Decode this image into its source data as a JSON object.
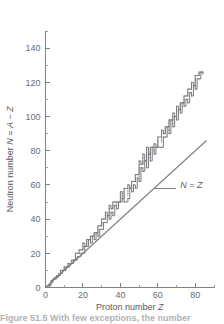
{
  "figure": {
    "caption": "Figure 51.5  With few exceptions, the number"
  },
  "axes": {
    "x": {
      "label_prefix": "Proton number ",
      "label_symbol": "Z",
      "ticks": [
        0,
        20,
        40,
        60,
        80
      ],
      "minor_tick_step": 10,
      "range": [
        0,
        90
      ]
    },
    "y": {
      "label_prefix": "Neutron number ",
      "label_symbol": "N",
      "label_equals": " = ",
      "label_symbol2": "A",
      "label_minus": " − ",
      "label_symbol3": "Z",
      "ticks": [
        0,
        20,
        40,
        60,
        80,
        100,
        120,
        140
      ],
      "minor_tick_step": 10,
      "range": [
        0,
        150
      ]
    }
  },
  "annotations": {
    "nz_line_label": "N = Z"
  },
  "colors": {
    "axis": "#808285",
    "data": "#77797c",
    "text": "#58595b",
    "background": "#ffffff"
  },
  "chart_data": {
    "type": "scatter",
    "title": "",
    "xlabel": "Proton number Z",
    "ylabel": "Neutron number N = A − Z",
    "xlim": [
      0,
      90
    ],
    "ylim": [
      0,
      150
    ],
    "grid": false,
    "legend": null,
    "annotations": [
      {
        "text": "N = Z",
        "x": 72,
        "y": 60,
        "leader_to": {
          "x": 58,
          "y": 58
        }
      }
    ],
    "series": [
      {
        "name": "N = Z reference line",
        "type": "line",
        "x": [
          0,
          86
        ],
        "y": [
          0,
          86
        ]
      },
      {
        "name": "Stable nuclides band",
        "type": "scatter",
        "note": "Band of stable nuclides; N rises faster than Z above Z~20",
        "points": [
          {
            "z": 1,
            "n": 0
          },
          {
            "z": 1,
            "n": 1
          },
          {
            "z": 2,
            "n": 1
          },
          {
            "z": 2,
            "n": 2
          },
          {
            "z": 3,
            "n": 3
          },
          {
            "z": 3,
            "n": 4
          },
          {
            "z": 4,
            "n": 5
          },
          {
            "z": 5,
            "n": 5
          },
          {
            "z": 5,
            "n": 6
          },
          {
            "z": 6,
            "n": 6
          },
          {
            "z": 6,
            "n": 7
          },
          {
            "z": 7,
            "n": 7
          },
          {
            "z": 7,
            "n": 8
          },
          {
            "z": 8,
            "n": 8
          },
          {
            "z": 8,
            "n": 9
          },
          {
            "z": 8,
            "n": 10
          },
          {
            "z": 9,
            "n": 10
          },
          {
            "z": 10,
            "n": 10
          },
          {
            "z": 10,
            "n": 11
          },
          {
            "z": 10,
            "n": 12
          },
          {
            "z": 11,
            "n": 12
          },
          {
            "z": 12,
            "n": 12
          },
          {
            "z": 12,
            "n": 13
          },
          {
            "z": 12,
            "n": 14
          },
          {
            "z": 13,
            "n": 14
          },
          {
            "z": 14,
            "n": 14
          },
          {
            "z": 14,
            "n": 15
          },
          {
            "z": 14,
            "n": 16
          },
          {
            "z": 15,
            "n": 16
          },
          {
            "z": 16,
            "n": 16
          },
          {
            "z": 16,
            "n": 17
          },
          {
            "z": 16,
            "n": 18
          },
          {
            "z": 16,
            "n": 20
          },
          {
            "z": 17,
            "n": 18
          },
          {
            "z": 17,
            "n": 20
          },
          {
            "z": 18,
            "n": 18
          },
          {
            "z": 18,
            "n": 20
          },
          {
            "z": 18,
            "n": 22
          },
          {
            "z": 19,
            "n": 20
          },
          {
            "z": 19,
            "n": 22
          },
          {
            "z": 20,
            "n": 20
          },
          {
            "z": 20,
            "n": 22
          },
          {
            "z": 20,
            "n": 23
          },
          {
            "z": 20,
            "n": 24
          },
          {
            "z": 20,
            "n": 26
          },
          {
            "z": 21,
            "n": 24
          },
          {
            "z": 22,
            "n": 24
          },
          {
            "z": 22,
            "n": 25
          },
          {
            "z": 22,
            "n": 26
          },
          {
            "z": 22,
            "n": 27
          },
          {
            "z": 22,
            "n": 28
          },
          {
            "z": 23,
            "n": 28
          },
          {
            "z": 24,
            "n": 26
          },
          {
            "z": 24,
            "n": 28
          },
          {
            "z": 24,
            "n": 29
          },
          {
            "z": 24,
            "n": 30
          },
          {
            "z": 25,
            "n": 30
          },
          {
            "z": 26,
            "n": 28
          },
          {
            "z": 26,
            "n": 30
          },
          {
            "z": 26,
            "n": 31
          },
          {
            "z": 26,
            "n": 32
          },
          {
            "z": 27,
            "n": 32
          },
          {
            "z": 28,
            "n": 30
          },
          {
            "z": 28,
            "n": 32
          },
          {
            "z": 28,
            "n": 33
          },
          {
            "z": 28,
            "n": 34
          },
          {
            "z": 28,
            "n": 36
          },
          {
            "z": 29,
            "n": 34
          },
          {
            "z": 29,
            "n": 36
          },
          {
            "z": 30,
            "n": 34
          },
          {
            "z": 30,
            "n": 36
          },
          {
            "z": 30,
            "n": 37
          },
          {
            "z": 30,
            "n": 38
          },
          {
            "z": 30,
            "n": 40
          },
          {
            "z": 31,
            "n": 38
          },
          {
            "z": 31,
            "n": 40
          },
          {
            "z": 32,
            "n": 38
          },
          {
            "z": 32,
            "n": 40
          },
          {
            "z": 32,
            "n": 41
          },
          {
            "z": 32,
            "n": 42
          },
          {
            "z": 32,
            "n": 44
          },
          {
            "z": 33,
            "n": 42
          },
          {
            "z": 34,
            "n": 40
          },
          {
            "z": 34,
            "n": 42
          },
          {
            "z": 34,
            "n": 43
          },
          {
            "z": 34,
            "n": 44
          },
          {
            "z": 34,
            "n": 46
          },
          {
            "z": 34,
            "n": 48
          },
          {
            "z": 35,
            "n": 44
          },
          {
            "z": 35,
            "n": 46
          },
          {
            "z": 36,
            "n": 42
          },
          {
            "z": 36,
            "n": 44
          },
          {
            "z": 36,
            "n": 46
          },
          {
            "z": 36,
            "n": 47
          },
          {
            "z": 36,
            "n": 48
          },
          {
            "z": 36,
            "n": 50
          },
          {
            "z": 37,
            "n": 48
          },
          {
            "z": 37,
            "n": 50
          },
          {
            "z": 38,
            "n": 46
          },
          {
            "z": 38,
            "n": 48
          },
          {
            "z": 38,
            "n": 49
          },
          {
            "z": 38,
            "n": 50
          },
          {
            "z": 39,
            "n": 50
          },
          {
            "z": 40,
            "n": 50
          },
          {
            "z": 40,
            "n": 51
          },
          {
            "z": 40,
            "n": 52
          },
          {
            "z": 40,
            "n": 54
          },
          {
            "z": 40,
            "n": 56
          },
          {
            "z": 41,
            "n": 52
          },
          {
            "z": 42,
            "n": 50
          },
          {
            "z": 42,
            "n": 53
          },
          {
            "z": 42,
            "n": 54
          },
          {
            "z": 42,
            "n": 55
          },
          {
            "z": 42,
            "n": 56
          },
          {
            "z": 42,
            "n": 58
          },
          {
            "z": 44,
            "n": 52
          },
          {
            "z": 44,
            "n": 54
          },
          {
            "z": 44,
            "n": 55
          },
          {
            "z": 44,
            "n": 56
          },
          {
            "z": 44,
            "n": 57
          },
          {
            "z": 44,
            "n": 58
          },
          {
            "z": 44,
            "n": 60
          },
          {
            "z": 45,
            "n": 58
          },
          {
            "z": 46,
            "n": 56
          },
          {
            "z": 46,
            "n": 58
          },
          {
            "z": 46,
            "n": 59
          },
          {
            "z": 46,
            "n": 60
          },
          {
            "z": 46,
            "n": 62
          },
          {
            "z": 47,
            "n": 60
          },
          {
            "z": 47,
            "n": 62
          },
          {
            "z": 48,
            "n": 58
          },
          {
            "z": 48,
            "n": 62
          },
          {
            "z": 48,
            "n": 63
          },
          {
            "z": 48,
            "n": 64
          },
          {
            "z": 48,
            "n": 66
          },
          {
            "z": 49,
            "n": 64
          },
          {
            "z": 49,
            "n": 66
          },
          {
            "z": 50,
            "n": 62
          },
          {
            "z": 50,
            "n": 64
          },
          {
            "z": 50,
            "n": 65
          },
          {
            "z": 50,
            "n": 66
          },
          {
            "z": 50,
            "n": 67
          },
          {
            "z": 50,
            "n": 68
          },
          {
            "z": 50,
            "n": 69
          },
          {
            "z": 50,
            "n": 70
          },
          {
            "z": 50,
            "n": 72
          },
          {
            "z": 50,
            "n": 74
          },
          {
            "z": 51,
            "n": 70
          },
          {
            "z": 51,
            "n": 72
          },
          {
            "z": 52,
            "n": 68
          },
          {
            "z": 52,
            "n": 70
          },
          {
            "z": 52,
            "n": 72
          },
          {
            "z": 52,
            "n": 73
          },
          {
            "z": 52,
            "n": 74
          },
          {
            "z": 52,
            "n": 76
          },
          {
            "z": 52,
            "n": 78
          },
          {
            "z": 53,
            "n": 74
          },
          {
            "z": 54,
            "n": 70
          },
          {
            "z": 54,
            "n": 72
          },
          {
            "z": 54,
            "n": 74
          },
          {
            "z": 54,
            "n": 75
          },
          {
            "z": 54,
            "n": 76
          },
          {
            "z": 54,
            "n": 77
          },
          {
            "z": 54,
            "n": 78
          },
          {
            "z": 54,
            "n": 80
          },
          {
            "z": 54,
            "n": 82
          },
          {
            "z": 55,
            "n": 78
          },
          {
            "z": 56,
            "n": 74
          },
          {
            "z": 56,
            "n": 76
          },
          {
            "z": 56,
            "n": 78
          },
          {
            "z": 56,
            "n": 79
          },
          {
            "z": 56,
            "n": 80
          },
          {
            "z": 56,
            "n": 81
          },
          {
            "z": 56,
            "n": 82
          },
          {
            "z": 57,
            "n": 82
          },
          {
            "z": 58,
            "n": 78
          },
          {
            "z": 58,
            "n": 80
          },
          {
            "z": 58,
            "n": 82
          },
          {
            "z": 58,
            "n": 84
          },
          {
            "z": 59,
            "n": 82
          },
          {
            "z": 60,
            "n": 82
          },
          {
            "z": 60,
            "n": 83
          },
          {
            "z": 60,
            "n": 84
          },
          {
            "z": 60,
            "n": 85
          },
          {
            "z": 60,
            "n": 86
          },
          {
            "z": 60,
            "n": 88
          },
          {
            "z": 62,
            "n": 82
          },
          {
            "z": 62,
            "n": 85
          },
          {
            "z": 62,
            "n": 86
          },
          {
            "z": 62,
            "n": 87
          },
          {
            "z": 62,
            "n": 88
          },
          {
            "z": 62,
            "n": 90
          },
          {
            "z": 62,
            "n": 92
          },
          {
            "z": 63,
            "n": 88
          },
          {
            "z": 63,
            "n": 90
          },
          {
            "z": 64,
            "n": 88
          },
          {
            "z": 64,
            "n": 90
          },
          {
            "z": 64,
            "n": 91
          },
          {
            "z": 64,
            "n": 92
          },
          {
            "z": 64,
            "n": 93
          },
          {
            "z": 64,
            "n": 94
          },
          {
            "z": 65,
            "n": 94
          },
          {
            "z": 66,
            "n": 90
          },
          {
            "z": 66,
            "n": 92
          },
          {
            "z": 66,
            "n": 94
          },
          {
            "z": 66,
            "n": 95
          },
          {
            "z": 66,
            "n": 96
          },
          {
            "z": 66,
            "n": 97
          },
          {
            "z": 66,
            "n": 98
          },
          {
            "z": 67,
            "n": 98
          },
          {
            "z": 68,
            "n": 94
          },
          {
            "z": 68,
            "n": 96
          },
          {
            "z": 68,
            "n": 98
          },
          {
            "z": 68,
            "n": 99
          },
          {
            "z": 68,
            "n": 100
          },
          {
            "z": 68,
            "n": 102
          },
          {
            "z": 69,
            "n": 100
          },
          {
            "z": 70,
            "n": 98
          },
          {
            "z": 70,
            "n": 100
          },
          {
            "z": 70,
            "n": 102
          },
          {
            "z": 70,
            "n": 103
          },
          {
            "z": 70,
            "n": 104
          },
          {
            "z": 70,
            "n": 106
          },
          {
            "z": 71,
            "n": 104
          },
          {
            "z": 72,
            "n": 102
          },
          {
            "z": 72,
            "n": 104
          },
          {
            "z": 72,
            "n": 105
          },
          {
            "z": 72,
            "n": 106
          },
          {
            "z": 72,
            "n": 107
          },
          {
            "z": 72,
            "n": 108
          },
          {
            "z": 73,
            "n": 108
          },
          {
            "z": 74,
            "n": 106
          },
          {
            "z": 74,
            "n": 108
          },
          {
            "z": 74,
            "n": 109
          },
          {
            "z": 74,
            "n": 110
          },
          {
            "z": 74,
            "n": 112
          },
          {
            "z": 75,
            "n": 110
          },
          {
            "z": 75,
            "n": 112
          },
          {
            "z": 76,
            "n": 108
          },
          {
            "z": 76,
            "n": 110
          },
          {
            "z": 76,
            "n": 112
          },
          {
            "z": 76,
            "n": 113
          },
          {
            "z": 76,
            "n": 114
          },
          {
            "z": 76,
            "n": 116
          },
          {
            "z": 77,
            "n": 114
          },
          {
            "z": 77,
            "n": 116
          },
          {
            "z": 78,
            "n": 112
          },
          {
            "z": 78,
            "n": 114
          },
          {
            "z": 78,
            "n": 116
          },
          {
            "z": 78,
            "n": 117
          },
          {
            "z": 78,
            "n": 118
          },
          {
            "z": 78,
            "n": 120
          },
          {
            "z": 79,
            "n": 118
          },
          {
            "z": 80,
            "n": 116
          },
          {
            "z": 80,
            "n": 118
          },
          {
            "z": 80,
            "n": 119
          },
          {
            "z": 80,
            "n": 120
          },
          {
            "z": 80,
            "n": 121
          },
          {
            "z": 80,
            "n": 122
          },
          {
            "z": 80,
            "n": 124
          },
          {
            "z": 81,
            "n": 122
          },
          {
            "z": 81,
            "n": 124
          },
          {
            "z": 82,
            "n": 122
          },
          {
            "z": 82,
            "n": 124
          },
          {
            "z": 82,
            "n": 125
          },
          {
            "z": 82,
            "n": 126
          },
          {
            "z": 83,
            "n": 126
          },
          {
            "z": 84,
            "n": 125
          },
          {
            "z": 84,
            "n": 126
          }
        ]
      }
    ]
  }
}
